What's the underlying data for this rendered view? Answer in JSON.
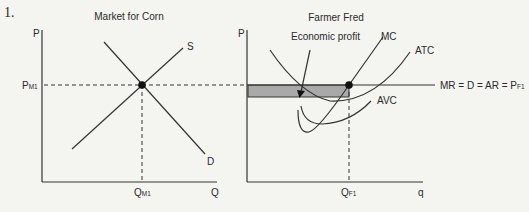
{
  "problem_number": "1.",
  "colors": {
    "background": "#f4f4f1",
    "line": "#333333",
    "shading": "#a9a9a9",
    "dot": "#111111"
  },
  "left_chart": {
    "title": "Market for Corn",
    "y_axis_label": "P",
    "x_axis_label": "Q",
    "price_label_main": "P",
    "price_label_sub": "M1",
    "quantity_label_main": "Q",
    "quantity_label_sub": "M1",
    "curves": {
      "supply_label": "S",
      "demand_label": "D"
    }
  },
  "right_chart": {
    "title": "Farmer Fred",
    "y_axis_label": "P",
    "x_axis_label": "q",
    "annotation": "Economic profit",
    "price_line_label_main": "MR = D = AR = P",
    "price_line_label_sub": "F1",
    "quantity_label_main": "Q",
    "quantity_label_sub": "F1",
    "curves": {
      "mc_label": "MC",
      "atc_label": "ATC",
      "avc_label": "AVC"
    }
  }
}
